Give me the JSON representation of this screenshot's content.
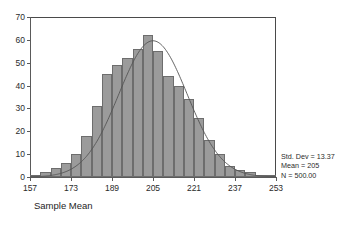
{
  "chart_data": {
    "type": "bar",
    "title": "",
    "subtitle": "",
    "xlabel": "Sample Mean",
    "ylabel": "",
    "xlim": [
      157,
      253
    ],
    "ylim": [
      0,
      70
    ],
    "grid": false,
    "legend_position": "right-bottom",
    "bin_width": 4,
    "x_ticks": [
      "157",
      "173",
      "189",
      "205",
      "221",
      "237",
      "253"
    ],
    "x_tick_values": [
      157,
      173,
      189,
      205,
      221,
      237,
      253
    ],
    "y_ticks": [
      "0",
      "10",
      "20",
      "30",
      "40",
      "50",
      "60",
      "70"
    ],
    "y_tick_values": [
      0,
      10,
      20,
      30,
      40,
      50,
      60,
      70
    ],
    "categories": [
      159,
      163,
      167,
      171,
      175,
      179,
      183,
      187,
      191,
      195,
      199,
      203,
      207,
      211,
      215,
      219,
      223,
      227,
      231,
      235,
      239,
      243,
      247,
      251
    ],
    "values": [
      1,
      2,
      4,
      6,
      10,
      18,
      31,
      45,
      49,
      52,
      56,
      62,
      55,
      44,
      40,
      34,
      26,
      16,
      10,
      5,
      3,
      2,
      1,
      1
    ],
    "bar_color": "#9b9b9b",
    "bar_edge_color": "#6d6d6d",
    "overlay": {
      "type": "normal-curve",
      "mean": 205,
      "std_dev": 13.37,
      "n": 500,
      "peak_value": 59.6,
      "color": "#555555"
    }
  },
  "legend": {
    "std_dev": "Std. Dev = 13.37",
    "mean": "Mean = 205",
    "n": "N = 500.00"
  }
}
